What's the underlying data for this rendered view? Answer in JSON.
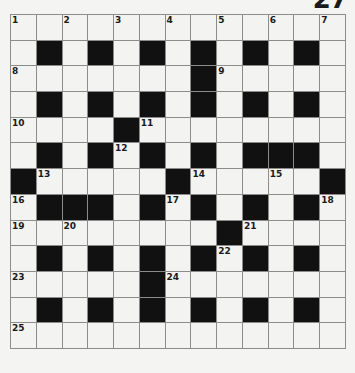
{
  "puzzle": {
    "number_label": "27",
    "rows": 13,
    "cols": 13,
    "colors": {
      "white_cell": "#f3f3f1",
      "black_cell": "#111111",
      "grid_line": "#8c8c8c"
    },
    "layout": [
      ".............",
      ".#.#.#.#.#.#.",
      ".......#.....",
      ".#.#.#.#.#.#.",
      "....#........",
      ".#.#.#.#.###.",
      "#.....#.....#",
      ".###.#.#.#.#.",
      "........#....",
      ".#.#.#.#.#.#.",
      ".....#.......",
      ".#.#.#.#.#.#.",
      "............."
    ],
    "clue_numbers": [
      {
        "n": "1",
        "r": 0,
        "c": 0
      },
      {
        "n": "2",
        "r": 0,
        "c": 2
      },
      {
        "n": "3",
        "r": 0,
        "c": 4
      },
      {
        "n": "4",
        "r": 0,
        "c": 6
      },
      {
        "n": "5",
        "r": 0,
        "c": 8
      },
      {
        "n": "6",
        "r": 0,
        "c": 10
      },
      {
        "n": "7",
        "r": 0,
        "c": 12
      },
      {
        "n": "8",
        "r": 2,
        "c": 0
      },
      {
        "n": "9",
        "r": 2,
        "c": 8
      },
      {
        "n": "10",
        "r": 4,
        "c": 0
      },
      {
        "n": "11",
        "r": 4,
        "c": 5
      },
      {
        "n": "12",
        "r": 5,
        "c": 4
      },
      {
        "n": "13",
        "r": 6,
        "c": 1
      },
      {
        "n": "14",
        "r": 6,
        "c": 7
      },
      {
        "n": "15",
        "r": 6,
        "c": 10
      },
      {
        "n": "16",
        "r": 7,
        "c": 0
      },
      {
        "n": "17",
        "r": 7,
        "c": 6
      },
      {
        "n": "18",
        "r": 7,
        "c": 12
      },
      {
        "n": "19",
        "r": 8,
        "c": 0
      },
      {
        "n": "20",
        "r": 8,
        "c": 2
      },
      {
        "n": "21",
        "r": 8,
        "c": 9
      },
      {
        "n": "22",
        "r": 9,
        "c": 8
      },
      {
        "n": "23",
        "r": 10,
        "c": 0
      },
      {
        "n": "24",
        "r": 10,
        "c": 6
      },
      {
        "n": "25",
        "r": 12,
        "c": 0
      }
    ]
  }
}
